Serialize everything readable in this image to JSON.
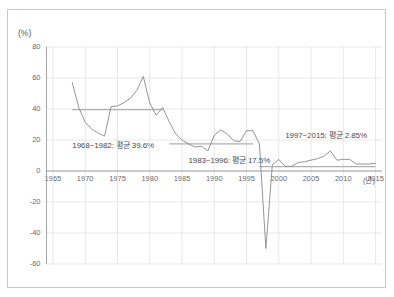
{
  "chart_data": {
    "type": "line",
    "title": "",
    "subtitle": "",
    "xlabel": "(년)",
    "ylabel": "(%)",
    "xlim": [
      1964,
      2016
    ],
    "ylim": [
      -60,
      80
    ],
    "grid": true,
    "legend_position": "none",
    "x_ticks": [
      "1965",
      "1970",
      "1975",
      "1980",
      "1985",
      "1990",
      "1995",
      "2000",
      "2005",
      "2010",
      "2015"
    ],
    "x_tick_values": [
      1965,
      1970,
      1975,
      1980,
      1985,
      1990,
      1995,
      2000,
      2005,
      2010,
      2015
    ],
    "y_ticks": [
      "80",
      "60",
      "40",
      "20",
      "0",
      "-20",
      "-40",
      "-60"
    ],
    "y_tick_values": [
      80,
      60,
      40,
      20,
      0,
      -20,
      -40,
      -60
    ],
    "series": [
      {
        "name": "연간 증가율",
        "color": "#8a8a8c",
        "x": [
          1968,
          1969,
          1970,
          1971,
          1972,
          1973,
          1974,
          1975,
          1976,
          1977,
          1978,
          1979,
          1980,
          1981,
          1982,
          1983,
          1984,
          1985,
          1986,
          1987,
          1988,
          1989,
          1990,
          1991,
          1992,
          1993,
          1994,
          1995,
          1996,
          1997,
          1998,
          1999,
          2000,
          2001,
          2002,
          2003,
          2004,
          2005,
          2006,
          2007,
          2008,
          2009,
          2010,
          2011,
          2012,
          2013,
          2014,
          2015
        ],
        "y": [
          57.0,
          41.0,
          31.5,
          27.0,
          24.5,
          22.5,
          41.5,
          42.0,
          44.0,
          47.0,
          52.0,
          61.0,
          44.0,
          36.0,
          41.0,
          32.0,
          24.0,
          20.0,
          17.5,
          15.5,
          16.0,
          13.0,
          23.0,
          26.5,
          24.0,
          19.5,
          19.0,
          26.0,
          26.0,
          17.5,
          -50.0,
          4.0,
          7.5,
          3.0,
          3.0,
          5.5,
          6.0,
          7.0,
          8.0,
          9.5,
          13.0,
          7.0,
          7.5,
          7.5,
          4.5,
          4.5,
          4.5,
          5.0
        ]
      }
    ],
    "reference_lines": [
      {
        "name": "mean-1968-1982",
        "value": 39.6,
        "x_start": 1968,
        "x_end": 1982,
        "color": "#b0b0b2"
      },
      {
        "name": "mean-1983-1996",
        "value": 17.5,
        "x_start": 1983,
        "x_end": 1996,
        "color": "#b0b0b2"
      },
      {
        "name": "mean-1997-2015",
        "value": 2.85,
        "x_start": 1997,
        "x_end": 2015,
        "color": "#b0b0b2"
      }
    ],
    "annotations": [
      {
        "name": "annotation-period-1",
        "text": "1968~1982: 평균 39.6%",
        "x": 1968,
        "y": 17
      },
      {
        "name": "annotation-period-2",
        "text": "1983~1996: 평균 17.5%",
        "x": 1986,
        "y": 7
      },
      {
        "name": "annotation-period-3",
        "text": "1997~2015: 평균 2.85%",
        "x": 2001,
        "y": 23
      }
    ]
  }
}
